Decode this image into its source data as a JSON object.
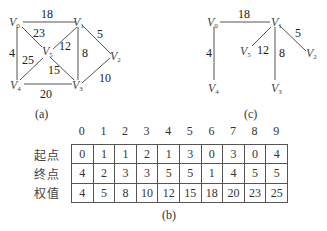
{
  "graph_a": {
    "caption": "(a)",
    "vertices": [
      {
        "id": "V0",
        "name": "V",
        "sub": "0",
        "x": 18,
        "y": 20
      },
      {
        "id": "V1",
        "name": "V",
        "sub": "1",
        "x": 80,
        "y": 20
      },
      {
        "id": "V2",
        "name": "V",
        "sub": "2",
        "x": 113,
        "y": 55
      },
      {
        "id": "V3",
        "name": "V",
        "sub": "3",
        "x": 78,
        "y": 85
      },
      {
        "id": "V4",
        "name": "V",
        "sub": "4",
        "x": 18,
        "y": 85
      },
      {
        "id": "V5",
        "name": "V",
        "sub": "5",
        "x": 46,
        "y": 52
      }
    ],
    "edges": [
      {
        "from": "V0",
        "to": "V1",
        "weight": "18"
      },
      {
        "from": "V0",
        "to": "V5",
        "weight": "23"
      },
      {
        "from": "V0",
        "to": "V4",
        "weight": "4"
      },
      {
        "from": "V1",
        "to": "V5",
        "weight": "12"
      },
      {
        "from": "V1",
        "to": "V3",
        "weight": "8"
      },
      {
        "from": "V1",
        "to": "V2",
        "weight": "5"
      },
      {
        "from": "V4",
        "to": "V5",
        "weight": "25"
      },
      {
        "from": "V5",
        "to": "V3",
        "weight": "15"
      },
      {
        "from": "V4",
        "to": "V3",
        "weight": "20"
      },
      {
        "from": "V3",
        "to": "V2",
        "weight": "10"
      }
    ]
  },
  "graph_c": {
    "caption": "(c)",
    "edges": [
      {
        "from": "V0",
        "to": "V1",
        "weight": "18"
      },
      {
        "from": "V0",
        "to": "V4",
        "weight": "4"
      },
      {
        "from": "V1",
        "to": "V5",
        "weight": "12"
      },
      {
        "from": "V1",
        "to": "V3",
        "weight": "8"
      },
      {
        "from": "V1",
        "to": "V2",
        "weight": "5"
      }
    ]
  },
  "table_b": {
    "caption": "(b)",
    "columns": [
      "0",
      "1",
      "2",
      "3",
      "4",
      "5",
      "6",
      "7",
      "8",
      "9"
    ],
    "rows": [
      {
        "label": "起点",
        "values": [
          "0",
          "1",
          "1",
          "2",
          "1",
          "3",
          "0",
          "3",
          "0",
          "4"
        ]
      },
      {
        "label": "终点",
        "values": [
          "4",
          "2",
          "3",
          "3",
          "5",
          "5",
          "1",
          "4",
          "5",
          "5"
        ]
      },
      {
        "label": "权值",
        "values": [
          "4",
          "5",
          "8",
          "10",
          "12",
          "15",
          "18",
          "20",
          "23",
          "25"
        ]
      }
    ]
  }
}
